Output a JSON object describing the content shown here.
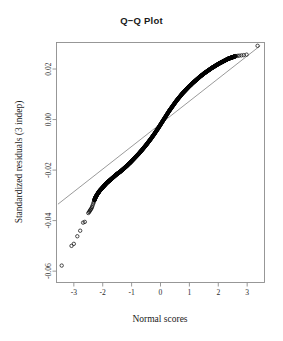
{
  "chart_data": {
    "type": "scatter",
    "title": "Q−Q Plot",
    "xlabel": "Normal scores",
    "ylabel": "Standardized residuals (3 indep)",
    "grid": false,
    "legend": null,
    "xlim": [
      -3.6,
      3.6
    ],
    "ylim": [
      -0.0645,
      0.0305
    ],
    "xticks": [
      -3,
      -2,
      -1,
      0,
      1,
      2,
      3
    ],
    "xtick_labels": [
      "-3",
      "-2",
      "-1",
      "0",
      "1",
      "2",
      "3"
    ],
    "yticks": [
      0.02,
      0.0,
      -0.02,
      -0.04,
      -0.06
    ],
    "ytick_labels": [
      "0.02",
      "0.00",
      "-0.02",
      "-0.04",
      "-0.06"
    ],
    "reference_line": {
      "style": "solid",
      "color": "#6f6f6f",
      "x": [
        -3.55,
        3.45
      ],
      "y": [
        -0.0335,
        0.0292
      ]
    },
    "marker": {
      "shape": "open-circle",
      "radius_px": 1.7,
      "color": "#111111"
    },
    "points": [
      [
        -3.42,
        -0.0578
      ],
      [
        -3.08,
        -0.05
      ],
      [
        -3.0,
        -0.0492
      ],
      [
        -2.88,
        -0.0462
      ],
      [
        -2.78,
        -0.044
      ],
      [
        -2.68,
        -0.0408
      ],
      [
        -2.62,
        -0.0405
      ],
      [
        -2.5,
        -0.037
      ],
      [
        -2.47,
        -0.0366
      ],
      [
        -2.45,
        -0.0362
      ],
      [
        -2.43,
        -0.0358
      ],
      [
        -2.41,
        -0.0355
      ],
      [
        -2.39,
        -0.0351
      ],
      [
        -2.37,
        -0.0346
      ],
      [
        -2.35,
        -0.034
      ],
      [
        -2.33,
        -0.0333
      ],
      [
        -2.31,
        -0.0327
      ],
      [
        -2.29,
        -0.032
      ],
      [
        -2.27,
        -0.0314
      ],
      [
        -2.25,
        -0.0308
      ],
      [
        -2.22,
        -0.0302
      ],
      [
        -2.19,
        -0.0296
      ],
      [
        -2.16,
        -0.0291
      ],
      [
        -2.13,
        -0.0286
      ],
      [
        -2.1,
        -0.0281
      ],
      [
        -2.06,
        -0.0276
      ],
      [
        -2.02,
        -0.0271
      ],
      [
        -1.98,
        -0.0266
      ],
      [
        -1.94,
        -0.0261
      ],
      [
        -1.9,
        -0.0256
      ],
      [
        -1.86,
        -0.0251
      ],
      [
        -1.82,
        -0.0247
      ],
      [
        -1.78,
        -0.0243
      ],
      [
        -1.74,
        -0.0239
      ],
      [
        -1.7,
        -0.0235
      ],
      [
        -1.66,
        -0.0231
      ],
      [
        -1.62,
        -0.0227
      ],
      [
        -1.58,
        -0.0223
      ],
      [
        -1.54,
        -0.0219
      ],
      [
        -1.5,
        -0.0215
      ],
      [
        -1.45,
        -0.0211
      ],
      [
        -1.4,
        -0.0207
      ],
      [
        -1.35,
        -0.0202
      ],
      [
        -1.3,
        -0.0197
      ],
      [
        -1.25,
        -0.0192
      ],
      [
        -1.2,
        -0.0187
      ],
      [
        -1.15,
        -0.0182
      ],
      [
        -1.1,
        -0.0176
      ],
      [
        -1.05,
        -0.0171
      ],
      [
        -1.0,
        -0.0165
      ],
      [
        -0.95,
        -0.0159
      ],
      [
        -0.9,
        -0.0153
      ],
      [
        -0.85,
        -0.0147
      ],
      [
        -0.8,
        -0.0141
      ],
      [
        -0.75,
        -0.0135
      ],
      [
        -0.7,
        -0.0128
      ],
      [
        -0.65,
        -0.0122
      ],
      [
        -0.6,
        -0.0115
      ],
      [
        -0.55,
        -0.0108
      ],
      [
        -0.5,
        -0.0101
      ],
      [
        -0.45,
        -0.0094
      ],
      [
        -0.4,
        -0.0086
      ],
      [
        -0.35,
        -0.0079
      ],
      [
        -0.3,
        -0.0071
      ],
      [
        -0.25,
        -0.0063
      ],
      [
        -0.2,
        -0.0055
      ],
      [
        -0.15,
        -0.0046
      ],
      [
        -0.1,
        -0.0038
      ],
      [
        -0.05,
        -0.0029
      ],
      [
        0.0,
        -0.002
      ],
      [
        0.05,
        -0.0011
      ],
      [
        0.1,
        -0.0002
      ],
      [
        0.15,
        0.0007
      ],
      [
        0.2,
        0.0016
      ],
      [
        0.25,
        0.0025
      ],
      [
        0.3,
        0.0034
      ],
      [
        0.35,
        0.0042
      ],
      [
        0.4,
        0.005
      ],
      [
        0.45,
        0.0058
      ],
      [
        0.5,
        0.0066
      ],
      [
        0.55,
        0.0074
      ],
      [
        0.6,
        0.0081
      ],
      [
        0.65,
        0.0088
      ],
      [
        0.7,
        0.0095
      ],
      [
        0.75,
        0.0102
      ],
      [
        0.8,
        0.0108
      ],
      [
        0.85,
        0.0114
      ],
      [
        0.9,
        0.012
      ],
      [
        0.95,
        0.0126
      ],
      [
        1.0,
        0.0132
      ],
      [
        1.05,
        0.0137
      ],
      [
        1.1,
        0.0143
      ],
      [
        1.15,
        0.0148
      ],
      [
        1.2,
        0.0153
      ],
      [
        1.25,
        0.0158
      ],
      [
        1.3,
        0.0163
      ],
      [
        1.35,
        0.0168
      ],
      [
        1.4,
        0.0173
      ],
      [
        1.45,
        0.0177
      ],
      [
        1.5,
        0.0182
      ],
      [
        1.55,
        0.0186
      ],
      [
        1.6,
        0.019
      ],
      [
        1.65,
        0.0194
      ],
      [
        1.7,
        0.0198
      ],
      [
        1.75,
        0.0202
      ],
      [
        1.8,
        0.0206
      ],
      [
        1.85,
        0.0209
      ],
      [
        1.9,
        0.0213
      ],
      [
        1.95,
        0.0216
      ],
      [
        2.0,
        0.022
      ],
      [
        2.05,
        0.0223
      ],
      [
        2.1,
        0.0226
      ],
      [
        2.15,
        0.0229
      ],
      [
        2.2,
        0.0232
      ],
      [
        2.25,
        0.0235
      ],
      [
        2.3,
        0.0238
      ],
      [
        2.35,
        0.0241
      ],
      [
        2.4,
        0.0243
      ],
      [
        2.45,
        0.0245
      ],
      [
        2.5,
        0.0247
      ],
      [
        2.55,
        0.0249
      ],
      [
        2.6,
        0.0251
      ],
      [
        2.66,
        0.0252
      ],
      [
        2.72,
        0.0253
      ],
      [
        2.8,
        0.0254
      ],
      [
        2.88,
        0.0255
      ],
      [
        2.98,
        0.0257
      ],
      [
        3.36,
        0.0292
      ]
    ],
    "dense_band": {
      "description": "Overlapping markers form a solid black band between normal scores -2.3 and 2.6",
      "x_start": -2.3,
      "x_end": 2.6
    },
    "n_points": 133
  },
  "figure": {
    "background_color": "#ffffff",
    "frame_color": "#8d8d8d",
    "text_color": "#1a1a1a"
  }
}
